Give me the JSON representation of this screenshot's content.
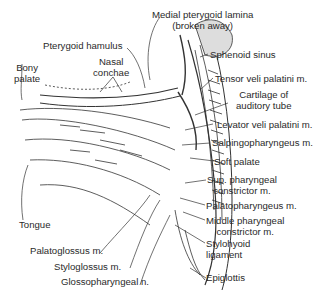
{
  "figure": {
    "type": "anatomical illustration"
  },
  "labels": {
    "medial_pterygoid_lamina": "Medial pterygoid lamina",
    "medial_pterygoid_lamina_note": "(broken away)",
    "pterygoid_hamulus": "Pterygoid hamulus",
    "sphenoid_sinus": "Sphenoid sinus",
    "nasal_conchae_1": "Nasal",
    "nasal_conchae_2": "conchae",
    "bony_palate_1": "Bony",
    "bony_palate_2": "palate",
    "tensor_veli_palatini": "Tensor veli palatini m.",
    "cartilage_auditory_tube_1": "Cartilage of",
    "cartilage_auditory_tube_2": "auditory tube",
    "levator_veli_palatini": "Levator veli palatini m.",
    "salpingopharyngeus": "Salpingopharyngeus m.",
    "soft_palate": "Soft palate",
    "sup_pharyngeal_constrictor_1": "Sup. pharyngeal",
    "sup_pharyngeal_constrictor_2": "constrictor m.",
    "palatopharyngeus": "Palatopharyngeus m.",
    "middle_pharyngeal_constrictor_1": "Middle pharyngeal",
    "middle_pharyngeal_constrictor_2": "constrictor m.",
    "stylohyoid_ligament_1": "Stylohyoid",
    "stylohyoid_ligament_2": "ligament",
    "tongue": "Tongue",
    "palatoglossus": "Palatoglossus m.",
    "epiglottis": "Epiglottis",
    "styloglossus": "Styloglossus m.",
    "glossopharyngeal": "Glossopharyngeal n."
  },
  "colors": {
    "ink": "#2a2a2a",
    "background": "#ffffff"
  }
}
